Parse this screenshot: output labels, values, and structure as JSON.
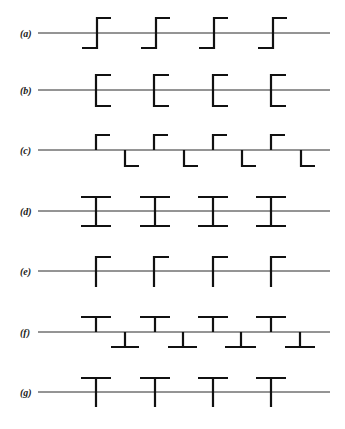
{
  "diagram": {
    "line_start_x": 38,
    "line_end_x": 330,
    "label_x": 20,
    "colors": {
      "ink": "#111111",
      "line": "#2a2a2a",
      "background": "#ffffff"
    },
    "rows": [
      {
        "id": "a",
        "label": "(a)",
        "baseline_y": 33,
        "pattern": "step-up",
        "description": "Z-shaped step: bottom bar left, vertical through line, top bar right",
        "shapes": [
          {
            "x": 97,
            "top": 18,
            "bottom": 48,
            "left": 82,
            "right": 111
          },
          {
            "x": 156,
            "top": 18,
            "bottom": 48,
            "left": 141,
            "right": 170
          },
          {
            "x": 214,
            "top": 18,
            "bottom": 48,
            "left": 199,
            "right": 228
          },
          {
            "x": 273,
            "top": 18,
            "bottom": 48,
            "left": 258,
            "right": 287
          }
        ]
      },
      {
        "id": "b",
        "label": "(b)",
        "baseline_y": 90,
        "pattern": "bracket-right",
        "description": "C-bracket opening right, centered on line",
        "shapes": [
          {
            "x": 96,
            "top": 75,
            "bottom": 106,
            "right": 111
          },
          {
            "x": 154,
            "top": 75,
            "bottom": 106,
            "right": 169
          },
          {
            "x": 213,
            "top": 75,
            "bottom": 106,
            "right": 228
          },
          {
            "x": 271,
            "top": 75,
            "bottom": 106,
            "right": 286
          }
        ]
      },
      {
        "id": "c",
        "label": "(c)",
        "baseline_y": 150,
        "pattern": "alternating-corners",
        "description": "Upper corners (hook right above line) alternating with lower corners (hook right below line)",
        "upper": [
          {
            "x": 96,
            "top": 135,
            "right": 110
          },
          {
            "x": 154,
            "top": 135,
            "right": 168
          },
          {
            "x": 213,
            "top": 135,
            "right": 227
          },
          {
            "x": 271,
            "top": 135,
            "right": 285
          }
        ],
        "lower": [
          {
            "x": 125,
            "bottom": 166,
            "right": 139
          },
          {
            "x": 184,
            "bottom": 166,
            "right": 198
          },
          {
            "x": 242,
            "bottom": 166,
            "right": 256
          },
          {
            "x": 301,
            "bottom": 166,
            "right": 315
          }
        ]
      },
      {
        "id": "d",
        "label": "(d)",
        "baseline_y": 211,
        "pattern": "i-beam",
        "description": "I-beam symmetric across line",
        "shapes": [
          {
            "x": 96,
            "top": 197,
            "bottom": 226,
            "left": 81,
            "right": 111
          },
          {
            "x": 155,
            "top": 197,
            "bottom": 226,
            "left": 140,
            "right": 170
          },
          {
            "x": 213,
            "top": 197,
            "bottom": 226,
            "left": 198,
            "right": 228
          },
          {
            "x": 271,
            "top": 197,
            "bottom": 226,
            "left": 256,
            "right": 286
          }
        ]
      },
      {
        "id": "e",
        "label": "(e)",
        "baseline_y": 271,
        "pattern": "flag",
        "description": "Vertical through line with top bar extending right",
        "shapes": [
          {
            "x": 96,
            "top": 257,
            "bottom": 287,
            "right": 111
          },
          {
            "x": 154,
            "top": 257,
            "bottom": 287,
            "right": 169
          },
          {
            "x": 213,
            "top": 257,
            "bottom": 287,
            "right": 228
          },
          {
            "x": 271,
            "top": 257,
            "bottom": 287,
            "right": 286
          }
        ]
      },
      {
        "id": "f",
        "label": "(f)",
        "baseline_y": 332,
        "pattern": "alternating-tees",
        "description": "Upright T above line alternating with inverted T below line",
        "upper": [
          {
            "x": 96,
            "top": 317,
            "left": 81,
            "right": 111
          },
          {
            "x": 155,
            "top": 317,
            "left": 140,
            "right": 170
          },
          {
            "x": 213,
            "top": 317,
            "left": 198,
            "right": 228
          },
          {
            "x": 271,
            "top": 317,
            "left": 256,
            "right": 286
          }
        ],
        "lower": [
          {
            "x": 125,
            "bottom": 347,
            "left": 111,
            "right": 139
          },
          {
            "x": 183,
            "bottom": 347,
            "left": 168,
            "right": 197
          },
          {
            "x": 241,
            "bottom": 347,
            "left": 225,
            "right": 256
          },
          {
            "x": 300,
            "bottom": 347,
            "left": 285,
            "right": 315
          }
        ]
      },
      {
        "id": "g",
        "label": "(g)",
        "baseline_y": 392,
        "pattern": "tee",
        "description": "T-shape with bar above line and stem crossing line",
        "shapes": [
          {
            "x": 96,
            "top": 378,
            "bottom": 407,
            "left": 81,
            "right": 111
          },
          {
            "x": 155,
            "top": 378,
            "bottom": 407,
            "left": 140,
            "right": 170
          },
          {
            "x": 213,
            "top": 378,
            "bottom": 407,
            "left": 198,
            "right": 228
          },
          {
            "x": 271,
            "top": 378,
            "bottom": 407,
            "left": 256,
            "right": 286
          }
        ]
      }
    ]
  }
}
